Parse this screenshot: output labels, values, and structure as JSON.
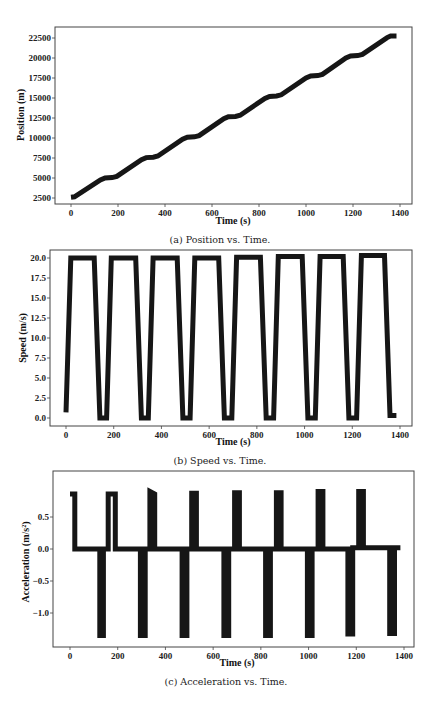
{
  "figure": {
    "panels": [
      {
        "id": "a",
        "caption": "(a) Position vs. Time.",
        "xlabel": "Time (s)",
        "ylabel": "Position (m)"
      },
      {
        "id": "b",
        "caption": "(b) Speed vs. Time.",
        "xlabel": "Time (s)",
        "ylabel": "Speed (m/s)"
      },
      {
        "id": "c",
        "caption": "(c) Acceleration vs. Time.",
        "xlabel": "Time (s)",
        "ylabel": "Acceleration (m/s²)"
      }
    ]
  },
  "chart_data": [
    {
      "type": "line",
      "title": "(a) Position vs. Time.",
      "xlabel": "Time (s)",
      "ylabel": "Position (m)",
      "xlim": [
        -40,
        1470
      ],
      "ylim": [
        2000,
        23300
      ],
      "xticks": [
        0,
        200,
        400,
        600,
        800,
        1000,
        1200,
        1400
      ],
      "yticks": [
        2500,
        5000,
        7500,
        10000,
        12500,
        15000,
        17500,
        20000,
        22500
      ],
      "grid": false,
      "series": [
        {
          "name": "position",
          "color": "#161616",
          "x": [
            0,
            15,
            125,
            145,
            175,
            195,
            300,
            320,
            350,
            370,
            475,
            495,
            525,
            545,
            650,
            670,
            700,
            720,
            825,
            845,
            875,
            895,
            1000,
            1020,
            1050,
            1070,
            1170,
            1190,
            1220,
            1240,
            1345,
            1360,
            1385
          ],
          "y": [
            2600,
            2650,
            4750,
            5000,
            5050,
            5200,
            7300,
            7550,
            7600,
            7750,
            9850,
            10100,
            10150,
            10300,
            12400,
            12650,
            12700,
            12850,
            14950,
            15200,
            15250,
            15400,
            17500,
            17750,
            17800,
            17950,
            20000,
            20250,
            20300,
            20450,
            22550,
            22750,
            22750
          ]
        }
      ]
    },
    {
      "type": "line",
      "title": "(b) Speed vs. Time.",
      "xlabel": "Time (s)",
      "ylabel": "Speed (m/s)",
      "xlim": [
        -60,
        1460
      ],
      "ylim": [
        -1.0,
        21.0
      ],
      "xticks": [
        0,
        200,
        400,
        600,
        800,
        1000,
        1200,
        1400
      ],
      "yticks": [
        0.0,
        2.5,
        5.0,
        7.5,
        10.0,
        12.5,
        15.0,
        17.5,
        20.0
      ],
      "grid": false,
      "series": [
        {
          "name": "speed",
          "color": "#161616",
          "x": [
            0,
            20,
            118,
            142,
            170,
            190,
            292,
            316,
            345,
            365,
            466,
            490,
            520,
            540,
            640,
            664,
            695,
            715,
            815,
            839,
            870,
            890,
            990,
            1014,
            1045,
            1065,
            1162,
            1186,
            1218,
            1238,
            1335,
            1358,
            1385
          ],
          "y": [
            0.7,
            20.0,
            20.0,
            0.0,
            0.0,
            20.0,
            20.0,
            0.0,
            0.0,
            20.0,
            20.0,
            0.0,
            0.0,
            20.0,
            20.0,
            0.0,
            0.0,
            20.1,
            20.1,
            0.0,
            0.0,
            20.2,
            20.2,
            0.0,
            0.0,
            20.2,
            20.2,
            0.0,
            0.0,
            20.3,
            20.3,
            0.3,
            0.3
          ]
        }
      ]
    },
    {
      "type": "line",
      "title": "(c) Acceleration vs. Time.",
      "xlabel": "Time (s)",
      "ylabel": "Acceleration (m/s²)",
      "xlim": [
        -40,
        1460
      ],
      "ylim": [
        -1.45,
        0.95
      ],
      "xticks": [
        0,
        200,
        400,
        600,
        800,
        1000,
        1200,
        1400
      ],
      "yticks": [
        -1.0,
        -0.5,
        0.0,
        0.5
      ],
      "grid": false,
      "series": [
        {
          "name": "acceleration",
          "color": "#161616",
          "x": [
            0,
            20,
            20,
            125,
            125,
            140,
            140,
            160,
            160,
            190,
            190,
            295,
            295,
            315,
            315,
            335,
            335,
            355,
            355,
            470,
            470,
            490,
            490,
            510,
            510,
            530,
            530,
            645,
            645,
            665,
            665,
            690,
            690,
            710,
            710,
            820,
            820,
            840,
            840,
            865,
            865,
            885,
            885,
            995,
            995,
            1015,
            1015,
            1040,
            1040,
            1060,
            1060,
            1165,
            1165,
            1185,
            1185,
            1210,
            1210,
            1230,
            1230,
            1340,
            1340,
            1360,
            1360,
            1385
          ],
          "y": [
            0.86,
            0.86,
            0.0,
            0.0,
            -1.35,
            -1.35,
            0.0,
            0.0,
            0.86,
            0.86,
            0.0,
            0.0,
            -1.35,
            -1.35,
            0.0,
            0.0,
            0.9,
            0.86,
            0.0,
            0.0,
            -1.35,
            -1.35,
            0.0,
            0.0,
            0.87,
            0.87,
            0.0,
            0.0,
            -1.35,
            -1.35,
            0.0,
            0.0,
            0.88,
            0.88,
            0.0,
            0.0,
            -1.35,
            -1.35,
            0.0,
            0.0,
            0.88,
            0.88,
            0.0,
            0.0,
            -1.35,
            -1.35,
            0.0,
            0.0,
            0.9,
            0.9,
            0.0,
            0.0,
            -1.33,
            -1.33,
            0.02,
            0.02,
            0.9,
            0.9,
            0.02,
            0.02,
            -1.32,
            -1.32,
            0.02,
            0.02
          ]
        }
      ]
    }
  ]
}
